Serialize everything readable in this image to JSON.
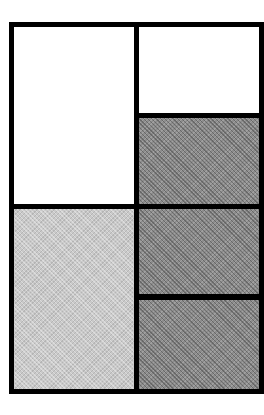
{
  "diagram": {
    "type": "grid-layout",
    "colors": {
      "border": "#000000",
      "white": "#ffffff",
      "light_gray": "#c9c9c9",
      "dark_gray": "#8c8c8c"
    },
    "cells": [
      {
        "id": "left-top",
        "fill": "white"
      },
      {
        "id": "left-bottom",
        "fill": "light_gray"
      },
      {
        "id": "right-1",
        "fill": "white"
      },
      {
        "id": "right-2",
        "fill": "dark_gray"
      },
      {
        "id": "right-3",
        "fill": "dark_gray"
      },
      {
        "id": "right-4",
        "fill": "dark_gray"
      }
    ]
  }
}
